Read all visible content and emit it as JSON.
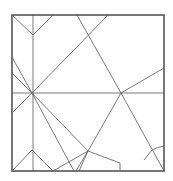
{
  "diagram": {
    "type": "crease-pattern",
    "canvas": {
      "width": 173,
      "height": 181
    },
    "colors": {
      "background": "#ffffff",
      "border": "#555555",
      "crease": "#6a6a6a"
    },
    "square": {
      "x": 12,
      "y": 15,
      "width": 152,
      "height": 156
    },
    "nodes": {
      "left_node": [
        32,
        93
      ],
      "right_node": [
        121,
        93
      ],
      "top_node": [
        88,
        35
      ],
      "bottom_node": [
        88,
        151
      ],
      "top_left_peak": [
        33,
        35
      ],
      "bottom_left_peak": [
        32,
        150
      ]
    },
    "lines": [
      [
        33,
        15,
        33,
        171
      ],
      [
        12,
        93,
        164,
        93
      ],
      [
        12,
        15,
        33,
        35
      ],
      [
        33,
        35,
        53,
        15
      ],
      [
        12,
        171,
        32,
        150
      ],
      [
        32,
        150,
        53,
        171
      ],
      [
        77,
        15,
        121,
        93
      ],
      [
        108,
        15,
        32,
        93
      ],
      [
        121,
        93,
        164,
        68
      ],
      [
        121,
        93,
        164,
        171
      ],
      [
        121,
        93,
        88,
        151
      ],
      [
        12,
        57,
        32,
        93
      ],
      [
        12,
        73,
        32,
        93
      ],
      [
        32,
        93,
        12,
        113
      ],
      [
        32,
        93,
        88,
        151
      ],
      [
        32,
        93,
        74,
        171
      ],
      [
        53,
        171,
        88,
        151
      ],
      [
        76,
        171,
        88,
        151
      ],
      [
        79,
        171,
        88,
        151
      ],
      [
        88,
        151,
        120,
        163
      ],
      [
        120,
        163,
        120,
        171
      ],
      [
        144,
        160,
        152,
        150
      ]
    ],
    "arcs": [
      {
        "d": "M152 150 Q157 147 164 146"
      }
    ]
  }
}
